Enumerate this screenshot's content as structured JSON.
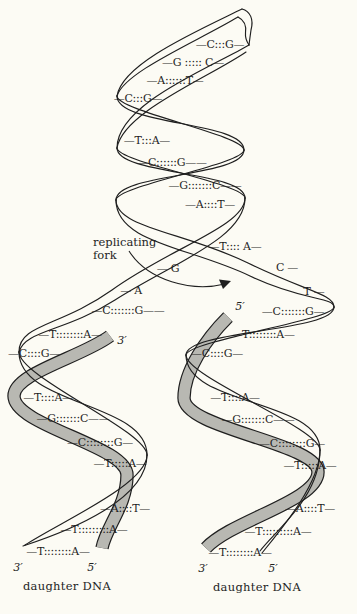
{
  "figure_type": "dna-replication-fork-diagram",
  "labels": {
    "fork_line1": "replicating",
    "fork_line2": "fork",
    "daughter_dna_left": "daughter DNA",
    "daughter_dna_right": "daughter DNA",
    "fork_3prime": "3′",
    "fork_5prime": "5′",
    "left_3prime": "3′",
    "left_5prime": "5′",
    "right_3prime": "3′",
    "right_5prime": "5′"
  },
  "pairs": {
    "parent": [
      "—C:::G—",
      "—G ::::: C—",
      "—A::::::T—",
      "—C:::G—",
      "—T:::A—",
      "—C::::::G——",
      "—G:::::::C——",
      "—A::::T—",
      "—T:::: A—"
    ],
    "fork_left": [
      "— G",
      "— A"
    ],
    "fork_right": [
      "C —",
      "T —"
    ],
    "left_branch": [
      "—C:::::::G——",
      "—T::::::::A—"
    ],
    "right_branch": [
      "—C:::::::G—",
      "—T::::::::A—"
    ],
    "left_daughter": [
      "—C::::G—",
      "—T::::A—",
      "—G:::::::C——",
      "—C::::::::G—",
      "—T:::::A—",
      "—A::::T—",
      "—T:::::::::A—",
      "—T::::::::A—"
    ],
    "right_daughter": [
      "—C::::G—",
      "—T::::A—",
      "—G:::::::C——",
      "—C::::::::G—",
      "—T:::::A—",
      "—A::::T—",
      "—T:::::::::A—",
      "—T::::::::A—"
    ]
  },
  "colors": {
    "ink": "#1f1f1f",
    "paper": "#fcfbf4",
    "new_strand_gray": "#b8b8b2"
  }
}
